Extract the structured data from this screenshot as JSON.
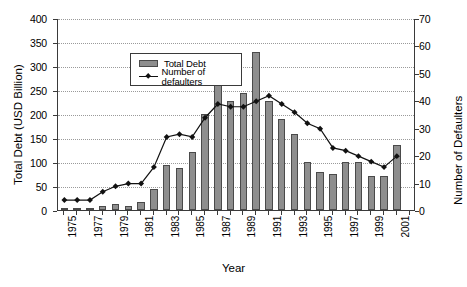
{
  "chart_data": {
    "type": "bar",
    "title": "",
    "xlabel": "Year",
    "ylabel": "Total Debt (USD Billion)",
    "y2label": "Number of Defaulters",
    "ylim": [
      0,
      400
    ],
    "y2lim": [
      0,
      70
    ],
    "yticks": [
      0,
      50,
      100,
      150,
      200,
      250,
      300,
      350,
      400
    ],
    "y2ticks": [
      0,
      10,
      20,
      30,
      40,
      50,
      60,
      70
    ],
    "grid": true,
    "legend_position": "upper-left",
    "categories": [
      1975,
      1976,
      1977,
      1978,
      1979,
      1980,
      1981,
      1982,
      1983,
      1984,
      1985,
      1986,
      1987,
      1988,
      1989,
      1990,
      1991,
      1992,
      1993,
      1994,
      1995,
      1996,
      1997,
      1998,
      1999,
      2000,
      2001,
      2002
    ],
    "tick_labels": [
      "1975",
      "",
      "1977",
      "",
      "1979",
      "",
      "1981",
      "",
      "1983",
      "",
      "1985",
      "",
      "1987",
      "",
      "1989",
      "",
      "1991",
      "",
      "1993",
      "",
      "1995",
      "",
      "1997",
      "",
      "1999",
      "",
      "2001",
      ""
    ],
    "series": [
      {
        "name": "Total Debt",
        "axis": "left",
        "type": "bar",
        "color": "#8e8e8e",
        "values": [
          3,
          4,
          5,
          9,
          13,
          8,
          16,
          43,
          93,
          87,
          120,
          199,
          287,
          228,
          243,
          330,
          227,
          189,
          158,
          99,
          80,
          74,
          101,
          101,
          70,
          71,
          135,
          0
        ]
      },
      {
        "name": "Number of defaulters",
        "axis": "right",
        "type": "line",
        "color": "#111111",
        "values": [
          4,
          4,
          4,
          7,
          9,
          10,
          10,
          16,
          27,
          28,
          27,
          34,
          39,
          38,
          38,
          40,
          42,
          39,
          36,
          32,
          30,
          23,
          22,
          20,
          18,
          16,
          20,
          0
        ]
      }
    ]
  },
  "legend": {
    "items": [
      {
        "label": "Total Debt",
        "marker": "bar-swatch"
      },
      {
        "label": "Number of defaulters",
        "marker": "line-diamond"
      }
    ]
  }
}
